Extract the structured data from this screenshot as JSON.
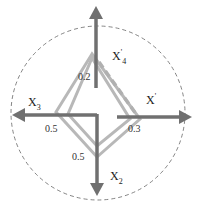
{
  "diagram": {
    "type": "four-axis radar diagram",
    "colors": {
      "axis": "#6e6e6e",
      "polygon": "#b4b4b4",
      "dashed_polygon": "#b4b4b4",
      "circle": "#555555"
    },
    "axes": [
      {
        "name": "X4",
        "label": "X",
        "subscript": "4",
        "superscript": "'",
        "direction": "up"
      },
      {
        "name": "X1",
        "label": "X",
        "subscript": "",
        "superscript": "'",
        "direction": "right"
      },
      {
        "name": "X2",
        "label": "X",
        "subscript": "2",
        "superscript": "",
        "direction": "down"
      },
      {
        "name": "X3",
        "label": "X",
        "subscript": "3",
        "superscript": "",
        "direction": "left"
      }
    ],
    "tick_values": {
      "up": "0.2",
      "right": "0.3",
      "down": "0.5",
      "left": "0.5"
    }
  }
}
